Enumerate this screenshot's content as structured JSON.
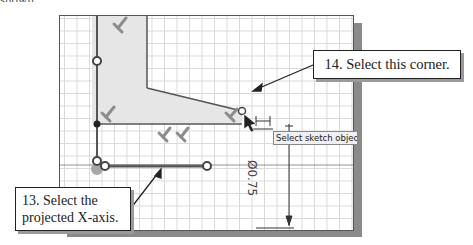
{
  "page": {
    "top_fragment": "shown."
  },
  "sketch": {
    "tooltip": "Select sketch objects",
    "dimension_label": "Ø0.75",
    "colors": {
      "grid": "#d9d9d9",
      "profile_fill": "#e6e6e6",
      "line": "#444444",
      "constraint": "#8c8c8c",
      "canvas_border": "#555555",
      "shadow": "#8a8a8a"
    }
  },
  "callouts": {
    "step14": "14. Select this corner.",
    "step13_line1": "13. Select the",
    "step13_line2": "projected X-axis."
  }
}
